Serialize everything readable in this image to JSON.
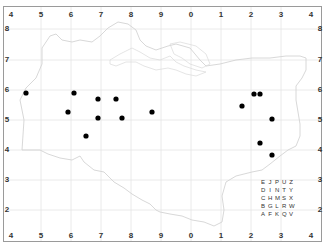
{
  "map": {
    "type": "grid-square distribution map",
    "background_color": "#ffffff",
    "grid_color": "#e2e2e2",
    "outline_color": "#d6d6d6",
    "dot_color": "#000000",
    "axes": {
      "top": [
        "4",
        "5",
        "6",
        "7",
        "8",
        "9",
        "0",
        "1",
        "2",
        "3",
        "4"
      ],
      "bottom": [
        "4",
        "5",
        "6",
        "7",
        "8",
        "9",
        "0",
        "1",
        "2",
        "3",
        "4"
      ],
      "left": [
        "8",
        "7",
        "6",
        "5",
        "4",
        "3",
        "2"
      ],
      "right": [
        "8",
        "7",
        "6",
        "5",
        "4",
        "3",
        "2"
      ],
      "corner_top_left": "4",
      "corner_top_right": "4",
      "corner_bottom_left": "4",
      "corner_bottom_right": "4"
    },
    "dots": [
      {
        "x": 26,
        "y": 93
      },
      {
        "x": 74,
        "y": 93
      },
      {
        "x": 98,
        "y": 99
      },
      {
        "x": 116,
        "y": 99
      },
      {
        "x": 68,
        "y": 112
      },
      {
        "x": 152,
        "y": 112
      },
      {
        "x": 98,
        "y": 118
      },
      {
        "x": 122,
        "y": 118
      },
      {
        "x": 86,
        "y": 136
      },
      {
        "x": 254,
        "y": 94
      },
      {
        "x": 260,
        "y": 94
      },
      {
        "x": 242,
        "y": 106
      },
      {
        "x": 272,
        "y": 119
      },
      {
        "x": 260,
        "y": 143
      },
      {
        "x": 272,
        "y": 155
      }
    ],
    "tetrad_key": {
      "rows": [
        [
          "E",
          "J",
          "P",
          "U",
          "Z"
        ],
        [
          "D",
          "I",
          "N",
          "T",
          "Y"
        ],
        [
          "C",
          "H",
          "M",
          "S",
          "X"
        ],
        [
          "B",
          "G",
          "L",
          "R",
          "W"
        ],
        [
          "A",
          "F",
          "K",
          "Q",
          "V"
        ]
      ]
    }
  }
}
